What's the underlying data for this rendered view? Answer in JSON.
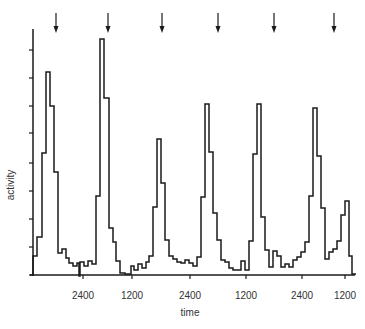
{
  "chart_data": {
    "type": "line",
    "style": "step",
    "title": "",
    "xlabel": "time",
    "ylabel": "activity",
    "x_tick_labels": [
      "2400",
      "1200",
      "2400",
      "1200",
      "2400",
      "1200"
    ],
    "y_ticks_count": 9,
    "ylim": [
      0,
      9
    ],
    "grid": false,
    "legend": null,
    "annotations": {
      "arrows": "6 downward arrows above the peaks marking events",
      "arrow_count": 6
    },
    "peaks": [
      {
        "index": 1,
        "max_activity": 7.2
      },
      {
        "index": 2,
        "max_activity": 8.6
      },
      {
        "index": 3,
        "max_activity": 5.7
      },
      {
        "index": 4,
        "max_activity": 6.2
      },
      {
        "index": 5,
        "max_activity": 6.1
      },
      {
        "index": 6,
        "max_activity": 5.5
      }
    ],
    "series": [
      {
        "name": "activity",
        "step_x_px": [
          33,
          37,
          42,
          46,
          50,
          54,
          58,
          62,
          66,
          69,
          73,
          77,
          79,
          80,
          84,
          88,
          92,
          96,
          100,
          104,
          109,
          113,
          116,
          120,
          125,
          131,
          134,
          138,
          142,
          146,
          149,
          153,
          157,
          161,
          165,
          169,
          173,
          177,
          181,
          185,
          189,
          193,
          197,
          201,
          205,
          209,
          213,
          217,
          221,
          225,
          229,
          233,
          237,
          241,
          245,
          249,
          253,
          257,
          261,
          265,
          269,
          273,
          277,
          281,
          285,
          289,
          293,
          297,
          301,
          305,
          309,
          313,
          317,
          321,
          325,
          329,
          333,
          337,
          341,
          345,
          349,
          352
        ],
        "step_y_px": [
          256,
          237,
          153,
          72,
          106,
          172,
          253,
          249,
          258,
          263,
          266,
          263,
          276,
          262,
          266,
          261,
          264,
          196,
          39,
          98,
          228,
          242,
          261,
          273,
          274,
          266,
          270,
          264,
          268,
          262,
          256,
          207,
          139,
          183,
          240,
          256,
          259,
          262,
          263,
          260,
          263,
          266,
          257,
          197,
          104,
          152,
          213,
          240,
          260,
          262,
          268,
          270,
          270,
          261,
          270,
          241,
          154,
          104,
          217,
          250,
          267,
          251,
          256,
          267,
          264,
          267,
          260,
          257,
          252,
          242,
          196,
          108,
          156,
          208,
          259,
          252,
          249,
          241,
          215,
          201,
          256,
          274
        ]
      }
    ],
    "axes_px": {
      "x0": 33,
      "x1": 355,
      "y_base": 275,
      "y_top": 29,
      "y_ticks": [
        275,
        247,
        219,
        191,
        163,
        133,
        106,
        78,
        50
      ],
      "x_ticks": [
        83,
        132,
        190,
        246,
        302,
        345
      ],
      "arrows_x": [
        56,
        108,
        162,
        218,
        274,
        334
      ]
    }
  }
}
